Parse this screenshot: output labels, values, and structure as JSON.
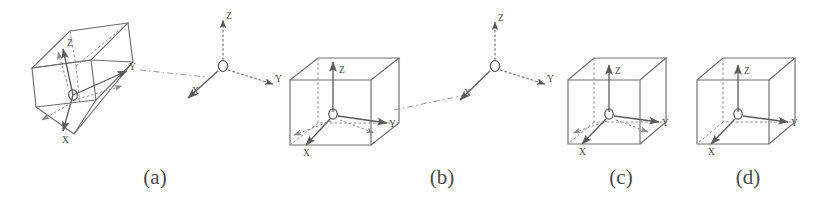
{
  "figure": {
    "type": "diagram",
    "subtype": "technical-line-drawing",
    "background_color": "#ffffff",
    "stroke_color": "#6e6e6e",
    "axis_color": "#5a5a5a",
    "dash_color": "#8c8c8c",
    "label_color": "#4a4a4a",
    "caption_color": "#4a4a4a"
  },
  "captions": [
    {
      "id": "a",
      "label": "(a)",
      "x": 155,
      "y": 175
    },
    {
      "id": "b",
      "label": "(b)",
      "x": 442,
      "y": 175
    },
    {
      "id": "c",
      "label": "(c)",
      "x": 621,
      "y": 175
    },
    {
      "id": "d",
      "label": "(d)",
      "x": 748,
      "y": 175
    }
  ],
  "panels": [
    {
      "id": "a",
      "name": "tilted-cuboid-with-frame",
      "box": {
        "x": 20,
        "y": 20,
        "width": 145,
        "height": 135
      },
      "cuboid_orientation": "tilted",
      "axis_labels": {
        "origin": "O",
        "x": "X",
        "y": "Y",
        "z": "Z"
      },
      "has_dashed_projection_arrows": true
    },
    {
      "id": "b",
      "name": "axis-aligned-cuboid-with-frame",
      "box": {
        "x": 290,
        "y": 55,
        "width": 110,
        "height": 95
      },
      "cuboid_orientation": "axis-aligned",
      "axis_labels": {
        "origin": "O",
        "x": "X",
        "y": "Y",
        "z": "Z"
      },
      "has_dashed_projection_arrows": true
    },
    {
      "id": "c",
      "name": "aligned-cuboid-with-frame",
      "box": {
        "x": 568,
        "y": 55,
        "width": 98,
        "height": 92
      },
      "cuboid_orientation": "axis-aligned",
      "axis_labels": {
        "origin": "O",
        "x": "X",
        "y": "Y",
        "z": "Z"
      },
      "has_dashed_projection_arrows": true
    },
    {
      "id": "d",
      "name": "final-cuboid-with-frame",
      "box": {
        "x": 697,
        "y": 55,
        "width": 98,
        "height": 92
      },
      "cuboid_orientation": "axis-aligned",
      "axis_labels": {
        "origin": "O",
        "x": "X",
        "y": "Y",
        "z": "Z"
      },
      "has_dashed_projection_arrows": false
    }
  ],
  "standalone_frames": [
    {
      "id": "frame-1",
      "name": "reference-frame-between-a-and-b",
      "origin": {
        "x": 223,
        "y": 66
      },
      "axis_labels": {
        "origin": "O",
        "x": "X",
        "y": "Y",
        "z": "Z"
      }
    },
    {
      "id": "frame-2",
      "name": "reference-frame-between-b-and-c",
      "origin": {
        "x": 495,
        "y": 66
      },
      "axis_labels": {
        "origin": "O",
        "x": "X",
        "y": "Y",
        "z": "Z"
      }
    }
  ],
  "leader_lines": [
    {
      "id": "leader-a-to-frame1",
      "from_panel": "a",
      "to_frame": "frame-1",
      "style": "dash-dot"
    },
    {
      "id": "leader-b-to-frame2",
      "from_panel": "b",
      "to_frame": "frame-2",
      "style": "dash-dot"
    }
  ]
}
